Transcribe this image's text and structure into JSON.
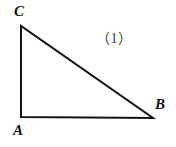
{
  "figure": {
    "type": "geometry-diagram",
    "shape": "right-triangle",
    "caption": "（1）",
    "background_color": "#ffffff",
    "stroke_color": "#141414",
    "stroke_width": 2,
    "labels": {
      "vertex_c": "C",
      "vertex_a": "A",
      "vertex_b": "B"
    },
    "vertices": {
      "C": {
        "x": 21,
        "y": 26
      },
      "A": {
        "x": 21,
        "y": 117
      },
      "B": {
        "x": 153,
        "y": 118
      }
    },
    "edges": [
      {
        "name": "CA",
        "from": "C",
        "to": "A"
      },
      {
        "name": "AB",
        "from": "A",
        "to": "B"
      },
      {
        "name": "BC",
        "from": "B",
        "to": "C"
      }
    ],
    "right_angle_at": "A",
    "polygon_points": "21,26 21,117 153,118"
  }
}
